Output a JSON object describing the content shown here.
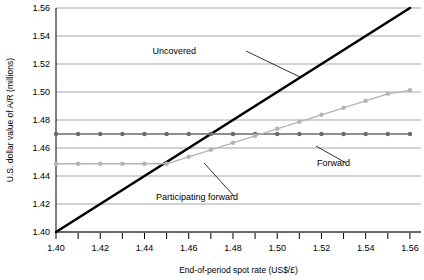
{
  "chart_data": {
    "type": "line",
    "title": "",
    "xlabel": "End-of-period spot rate (US$/£)",
    "ylabel": "U.S. dollar value of A/R (millions)",
    "xlim": [
      1.4,
      1.565
    ],
    "ylim": [
      1.4,
      1.56
    ],
    "xticks": [
      1.4,
      1.41,
      1.42,
      1.43,
      1.44,
      1.45,
      1.46,
      1.47,
      1.48,
      1.49,
      1.5,
      1.51,
      1.52,
      1.53,
      1.54,
      1.55,
      1.56
    ],
    "xtick_labels": [
      "1.40",
      "",
      "1.42",
      "",
      "1.44",
      "",
      "1.46",
      "",
      "1.48",
      "",
      "1.50",
      "",
      "1.52",
      "",
      "1.54",
      "",
      "1.56"
    ],
    "yticks": [
      1.4,
      1.42,
      1.44,
      1.46,
      1.48,
      1.5,
      1.52,
      1.54,
      1.56
    ],
    "ytick_labels": [
      "1.40",
      "1.42",
      "1.44",
      "1.46",
      "1.48",
      "1.50",
      "1.52",
      "1.54",
      "1.56"
    ],
    "grid": true,
    "grid_axis": "y",
    "legend_position": "inline-annotations",
    "x": [
      1.4,
      1.41,
      1.42,
      1.43,
      1.44,
      1.45,
      1.46,
      1.47,
      1.48,
      1.49,
      1.5,
      1.51,
      1.52,
      1.53,
      1.54,
      1.55,
      1.56
    ],
    "series": [
      {
        "name": "Uncovered",
        "color": "#000000",
        "line_width": 2.6,
        "markers": false,
        "values": [
          1.4,
          1.41,
          1.42,
          1.43,
          1.44,
          1.45,
          1.46,
          1.47,
          1.48,
          1.49,
          1.5,
          1.51,
          1.52,
          1.53,
          1.54,
          1.55,
          1.56
        ]
      },
      {
        "name": "Forward",
        "color": "#6b6b6b",
        "line_width": 1.4,
        "markers": true,
        "values": [
          1.47,
          1.47,
          1.47,
          1.47,
          1.47,
          1.47,
          1.47,
          1.47,
          1.47,
          1.47,
          1.47,
          1.47,
          1.47,
          1.47,
          1.47,
          1.47,
          1.47
        ]
      },
      {
        "name": "Participating forward",
        "color": "#b4b4b4",
        "line_width": 1.4,
        "markers": true,
        "values": [
          1.4487,
          1.4487,
          1.4487,
          1.4487,
          1.4487,
          1.4487,
          1.4537,
          1.4587,
          1.4637,
          1.4687,
          1.4737,
          1.4787,
          1.4837,
          1.4887,
          1.4937,
          1.4987,
          1.5012
        ]
      }
    ],
    "annotations": [
      {
        "name": "uncovered",
        "text": "Uncovered",
        "text_x": 196,
        "text_y": 54,
        "leader": [
          [
            246,
            51
          ],
          [
            300,
            77
          ]
        ]
      },
      {
        "name": "forward",
        "text": "Forward",
        "text_x": 350,
        "text_y": 166,
        "leader": [
          [
            346,
            163
          ],
          [
            316,
            146
          ]
        ]
      },
      {
        "name": "participating-forward",
        "text": "Participating forward",
        "text_x": 238,
        "text_y": 200,
        "leader": [
          [
            234,
            196
          ],
          [
            204,
            163
          ]
        ]
      }
    ]
  }
}
